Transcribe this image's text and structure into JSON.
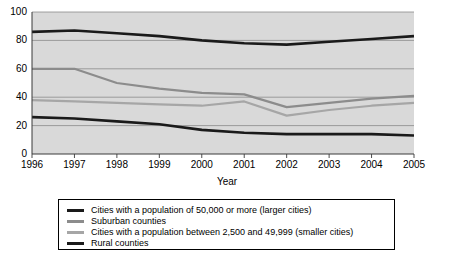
{
  "clipped_header_text": "",
  "chart_data": {
    "type": "line",
    "title": "",
    "xlabel": "Year",
    "ylabel": "",
    "x": [
      1996,
      1997,
      1998,
      1999,
      2000,
      2001,
      2002,
      2003,
      2004,
      2005
    ],
    "xlim": [
      1996,
      2005
    ],
    "ylim": [
      0,
      100
    ],
    "yticks": [
      0,
      20,
      40,
      60,
      80,
      100
    ],
    "xticks": [
      "1996",
      "1997",
      "1998",
      "1999",
      "2000",
      "2001",
      "2002",
      "2003",
      "2004",
      "2005"
    ],
    "grid": "horizontal",
    "legend_position": "below",
    "plot_background": "#d9d9d9",
    "series": [
      {
        "name": "Cities with a population of 50,000 or more (larger cities)",
        "color": "#1a1a1a",
        "width": 2.6,
        "values": [
          86,
          87,
          85,
          83,
          80,
          78,
          77,
          79,
          81,
          83
        ]
      },
      {
        "name": "Suburban counties",
        "color": "#8c8c8c",
        "width": 2.2,
        "values": [
          60,
          60,
          50,
          46,
          43,
          42,
          33,
          36,
          39,
          41
        ]
      },
      {
        "name": "Cities with a population between 2,500 and 49,999 (smaller cities)",
        "color": "#a6a6a6",
        "width": 2.2,
        "values": [
          38,
          37,
          36,
          35,
          34,
          37,
          27,
          31,
          34,
          36
        ]
      },
      {
        "name": "Rural counties",
        "color": "#1a1a1a",
        "width": 2.6,
        "values": [
          26,
          25,
          23,
          21,
          17,
          15,
          14,
          14,
          14,
          13
        ]
      }
    ]
  },
  "legend": {
    "entries": [
      {
        "label": "Cities with a population of 50,000 or more (larger cities)",
        "color": "#1a1a1a"
      },
      {
        "label": "Suburban counties",
        "color": "#8c8c8c"
      },
      {
        "label": "Cities with a population between 2,500 and 49,999 (smaller cities)",
        "color": "#a6a6a6"
      },
      {
        "label": "Rural counties",
        "color": "#1a1a1a"
      }
    ]
  }
}
